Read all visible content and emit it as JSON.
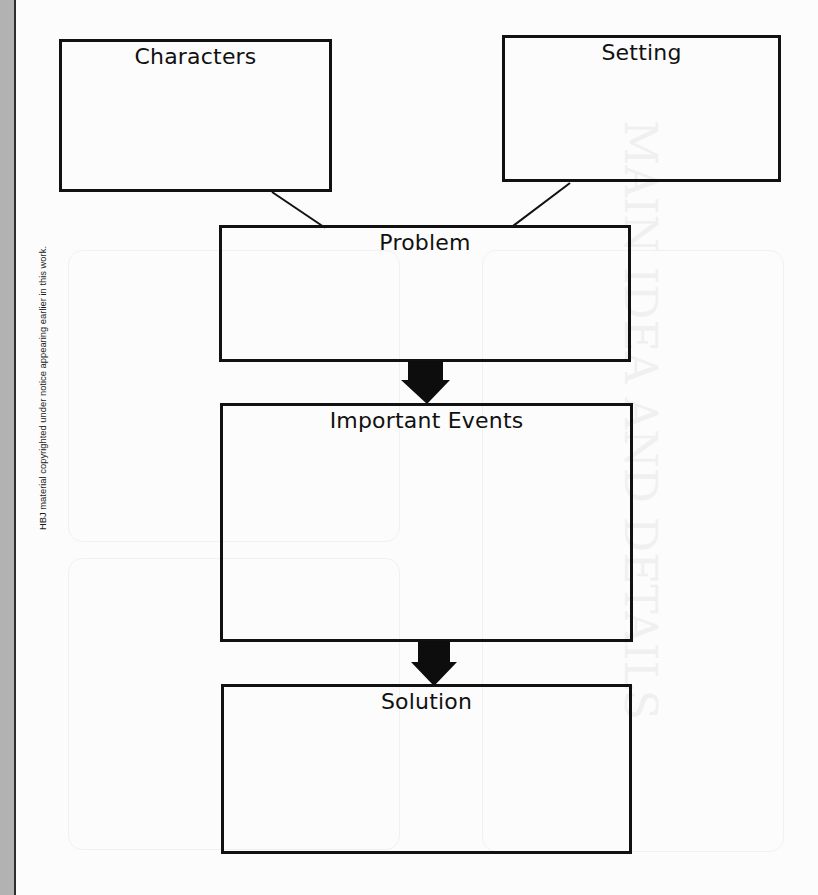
{
  "page": {
    "title": "STORY MAP",
    "copyright_notice": "HBJ material copyrighted under notice appearing earlier in this work."
  },
  "diagram": {
    "boxes": [
      {
        "id": "characters",
        "label": "Characters"
      },
      {
        "id": "setting",
        "label": "Setting"
      },
      {
        "id": "problem",
        "label": "Problem"
      },
      {
        "id": "important-events",
        "label": "Important Events"
      },
      {
        "id": "solution",
        "label": "Solution"
      }
    ],
    "connectors": [
      {
        "from": "characters",
        "to": "problem",
        "type": "line"
      },
      {
        "from": "setting",
        "to": "problem",
        "type": "line"
      },
      {
        "from": "problem",
        "to": "important-events",
        "type": "arrow"
      },
      {
        "from": "important-events",
        "to": "solution",
        "type": "arrow"
      }
    ]
  },
  "colors": {
    "ink": "#111111",
    "page": "#fcfcfc",
    "margin_strip": "#b2b2b2"
  }
}
